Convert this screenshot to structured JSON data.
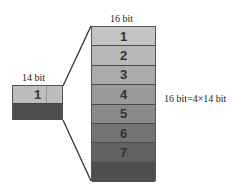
{
  "diagram": {
    "small_block": {
      "title": "14 bit",
      "segment_label": "1",
      "top_color": "#bdbdbd",
      "bottom_color": "#4d4d4d"
    },
    "large_block": {
      "title": "16 bit",
      "bands": [
        {
          "label": "1",
          "color": "#c4c4c4"
        },
        {
          "label": "2",
          "color": "#b8b8b8"
        },
        {
          "label": "3",
          "color": "#aaaaaa"
        },
        {
          "label": "4",
          "color": "#9a9a9a"
        },
        {
          "label": "5",
          "color": "#8a8a8a"
        },
        {
          "label": "6",
          "color": "#747474"
        },
        {
          "label": "7",
          "color": "#626262"
        },
        {
          "label": "",
          "color": "#4e4e4e"
        }
      ]
    },
    "equation": "16 bit=4×14 bit"
  }
}
